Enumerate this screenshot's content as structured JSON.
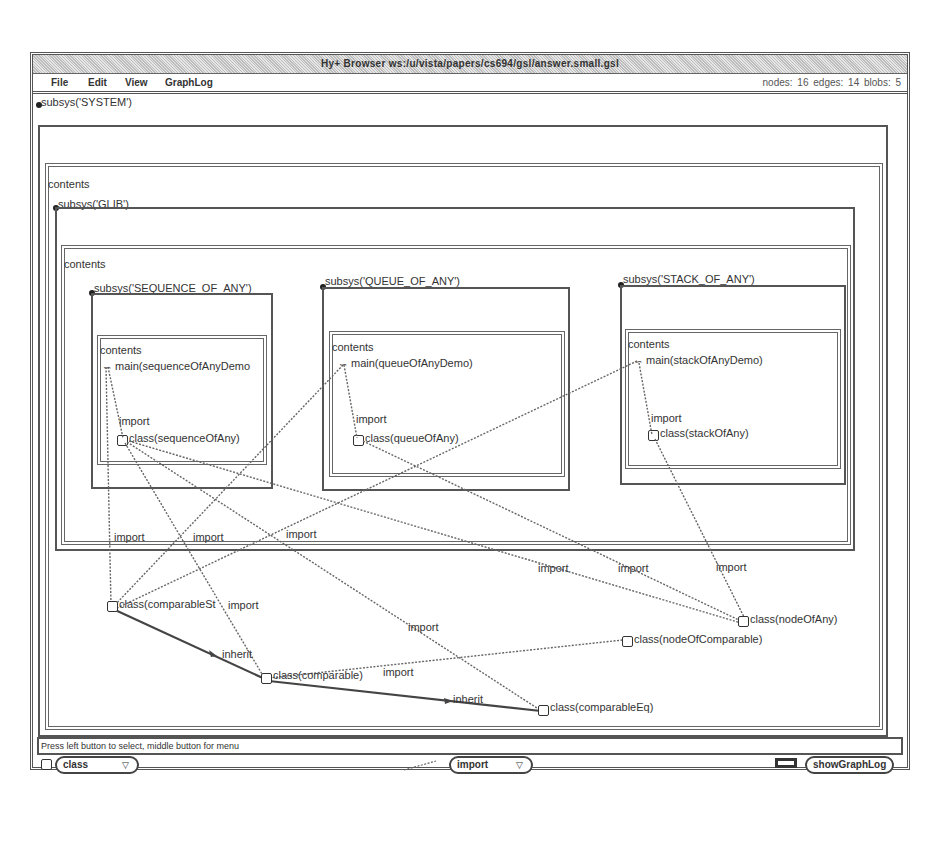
{
  "window": {
    "title": "Hy+ Browser ws:/u/vista/papers/cs694/gsl/answer.small.gsl"
  },
  "menubar": {
    "items": [
      {
        "label": "File"
      },
      {
        "label": "Edit"
      },
      {
        "label": "View"
      },
      {
        "label": "GraphLog"
      }
    ],
    "stats": "nodes: 16   edges: 14   blobs: 5"
  },
  "graph": {
    "system": {
      "label": "subsys('SYSTEM')"
    },
    "system_contents": {
      "label": "contents"
    },
    "glib": {
      "label": "subsys('GLIB')"
    },
    "glib_contents": {
      "label": "contents"
    },
    "subsystems": [
      {
        "label": "subsys('SEQUENCE_OF_ANY')",
        "contents": "contents",
        "main": "main(sequenceOfAnyDemo",
        "import_label": "import",
        "class": "class(sequenceOfAny)"
      },
      {
        "label": "subsys('QUEUE_OF_ANY')",
        "contents": "contents",
        "main": "main(queueOfAnyDemo)",
        "import_label": "import",
        "class": "class(queueOfAny)"
      },
      {
        "label": "subsys('STACK_OF_ANY')",
        "contents": "contents",
        "main": "main(stackOfAnyDemo)",
        "import_label": "import",
        "class": "class(stackOfAny)"
      }
    ],
    "outer_nodes": {
      "comparableSt": "class(comparableSt",
      "comparable": "class(comparable)",
      "comparableEq": "class(comparableEq)",
      "nodeOfAny": "class(nodeOfAny)",
      "nodeOfComparable": "class(nodeOfComparable)"
    },
    "edge_labels": {
      "import_1": "import",
      "import_2": "import",
      "import_3": "import",
      "import_4": "import",
      "import_5": "import",
      "import_6": "import",
      "import_7": "import",
      "import_8": "import",
      "import_9": "import",
      "inherit_1": "inherit",
      "inherit_2": "inherit"
    }
  },
  "status": {
    "message": "Press left button to select, middle button for menu"
  },
  "bottombar": {
    "node_type": "class",
    "edge_type": "import",
    "show_button": "showGraphLog"
  }
}
